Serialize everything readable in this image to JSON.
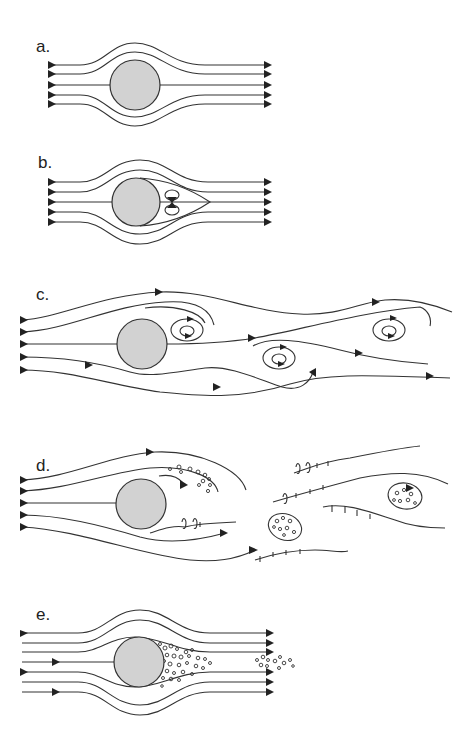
{
  "figure": {
    "body_fill": "#d2d2d2",
    "line_color": "#333333",
    "panels": [
      {
        "id": "a",
        "label": "a.",
        "regime": "laminar attached flow, no separation"
      },
      {
        "id": "b",
        "label": "b.",
        "regime": "pair of fixed standing vortices behind the cylinder"
      },
      {
        "id": "c",
        "label": "c.",
        "regime": "periodic vortex shedding (von Karman vortex street)"
      },
      {
        "id": "d",
        "label": "d.",
        "regime": "turbulent wake with separated eddies"
      },
      {
        "id": "e",
        "label": "e.",
        "regime": "narrow turbulent wake, delayed separation"
      }
    ]
  }
}
